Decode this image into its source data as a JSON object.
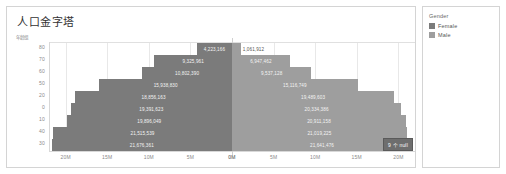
{
  "header": {
    "title": "人口金字塔"
  },
  "axes": {
    "y_axis_title": "年龄组",
    "y_tick_labels": [
      "80",
      "70",
      "60",
      "50",
      "20",
      "0",
      "10",
      "40",
      "30"
    ],
    "x_tick_labels_left": [
      "20M",
      "15M",
      "10M",
      "5M",
      "0M"
    ],
    "x_tick_labels_right": [
      "0M",
      "5M",
      "10M",
      "15M",
      "20M"
    ]
  },
  "legend": {
    "title": "Gender",
    "items": [
      {
        "label": "Female",
        "color": "#7b7b7b"
      },
      {
        "label": "Male",
        "color": "#9e9e9e"
      }
    ]
  },
  "null_badge": {
    "label": "9 个 null"
  },
  "colors": {
    "female": "#7b7b7b",
    "male": "#9e9e9e",
    "panel_border": "#d4d4d4",
    "grid": "#e8e8e8",
    "axis_text": "#8a8a8a",
    "badge_bg": "#6e6e6e"
  },
  "chart_data": {
    "type": "bar",
    "title": "人口金字塔",
    "subtype": "population-pyramid",
    "xlabel": "",
    "ylabel": "年龄组",
    "xlim": [
      -22000000,
      22000000
    ],
    "x_tick_values": [
      20000000,
      15000000,
      10000000,
      5000000,
      0,
      0,
      5000000,
      10000000,
      15000000,
      20000000
    ],
    "grid": true,
    "legend_position": "right",
    "categories": [
      "80",
      "70",
      "60",
      "50",
      "20",
      "0",
      "10",
      "40",
      "30"
    ],
    "series": [
      {
        "name": "Female",
        "color": "#7b7b7b",
        "direction": "left",
        "values": [
          4223166,
          9325961,
          10802390,
          15938830,
          18856163,
          19391623,
          19896049,
          21515539,
          21676361
        ],
        "labels": [
          "4,223,166",
          "9,325,961",
          "10,802,390",
          "15,938,830",
          "18,856,163",
          "19,391,623",
          "19,896,049",
          "21,515,539",
          "21,676,361"
        ]
      },
      {
        "name": "Male",
        "color": "#9e9e9e",
        "direction": "right",
        "values": [
          1061912,
          6947462,
          9537128,
          15116749,
          19489603,
          20334386,
          20911158,
          21019225,
          21641476
        ],
        "labels": [
          "1,061,912",
          "6,947,462",
          "9,537,128",
          "15,116,749",
          "19,489,603",
          "20,334,386",
          "20,911,158",
          "21,019,225",
          "21,641,476"
        ]
      }
    ]
  }
}
